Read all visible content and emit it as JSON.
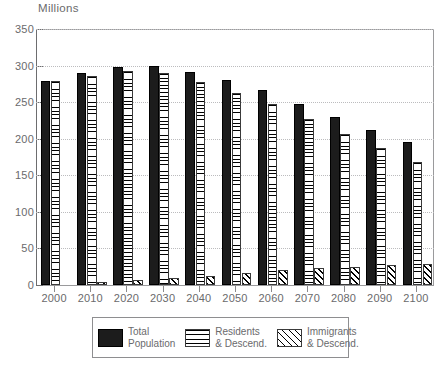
{
  "chart_data": {
    "type": "bar",
    "title": "",
    "subtitle": "",
    "ylabel": "Millions",
    "xlabel": "",
    "ylim": [
      0,
      350
    ],
    "yticks": [
      0,
      50,
      100,
      150,
      200,
      250,
      300,
      350
    ],
    "grid": true,
    "legend_position": "bottom",
    "categories": [
      "2000",
      "2010",
      "2020",
      "2030",
      "2040",
      "2050",
      "2060",
      "2070",
      "2080",
      "2090",
      "2100"
    ],
    "series": [
      {
        "name": "Total Population",
        "pattern": "solid-black",
        "values": [
          279,
          290,
          298,
          299,
          291,
          280,
          266,
          248,
          230,
          212,
          196
        ]
      },
      {
        "name": "Residents & Descend.",
        "pattern": "horizontal-lines",
        "values": [
          279,
          286,
          292,
          290,
          278,
          263,
          247,
          227,
          206,
          187,
          168
        ]
      },
      {
        "name": "Immigrants & Descend.",
        "pattern": "diagonal-hatch",
        "values": [
          0,
          4,
          7,
          10,
          13,
          17,
          20,
          23,
          25,
          27,
          29
        ]
      }
    ]
  },
  "legend": {
    "items": [
      {
        "label_line1": "Total",
        "label_line2": "Population",
        "swatch": "solid-black-swatch"
      },
      {
        "label_line1": "Residents",
        "label_line2": "& Descend.",
        "swatch": "horizontal-lines-swatch"
      },
      {
        "label_line1": "Immigrants",
        "label_line2": "& Descend.",
        "swatch": "diagonal-hatch-swatch"
      }
    ]
  },
  "colors": {
    "total": "#1c1c1c",
    "text": "#6a6a6c",
    "axis": "#6d6d6f",
    "grid": "#bcbcbe",
    "background": "#ffffff"
  }
}
